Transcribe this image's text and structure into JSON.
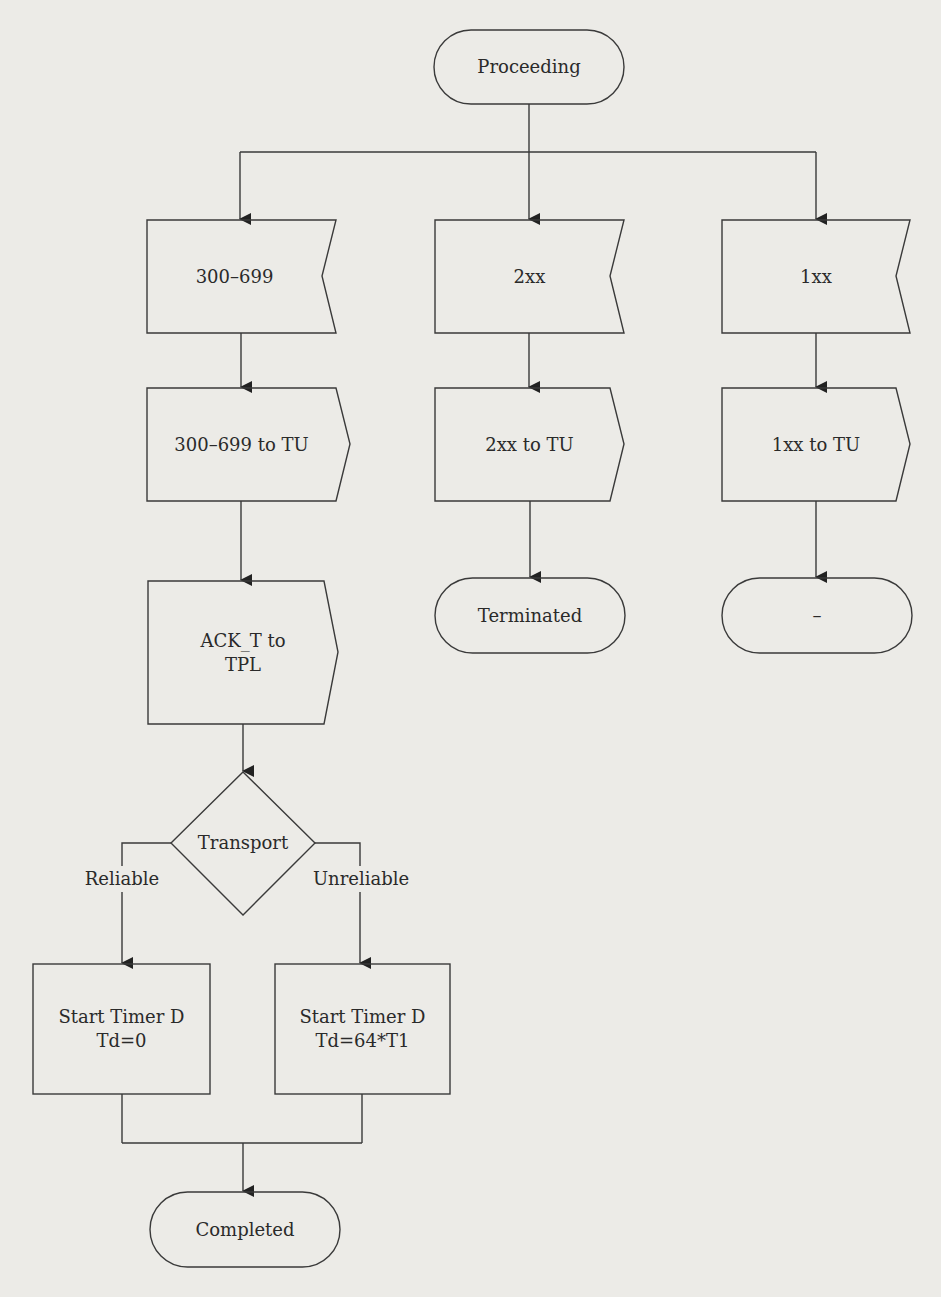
{
  "diagram": {
    "type": "flowchart",
    "start_state": "Proceeding",
    "branches": [
      {
        "receive": "300–699",
        "send": "300–699 to TU"
      },
      {
        "receive": "2xx",
        "send": "2xx to TU",
        "end_state": "Terminated"
      },
      {
        "receive": "1xx",
        "send": "1xx to TU",
        "end_state": "–"
      }
    ],
    "ack_send": "ACK_T to\nTPL",
    "decision": {
      "label": "Transport",
      "yes_label": "Reliable",
      "no_label": "Unreliable"
    },
    "timer_reliable": "Start Timer D\nTd=0",
    "timer_unreliable": "Start Timer D\nTd=64*T1",
    "final_state": "Completed"
  },
  "colors": {
    "background": "#ecebe7",
    "stroke": "#3a3a3a",
    "text": "#2a2a2a"
  }
}
